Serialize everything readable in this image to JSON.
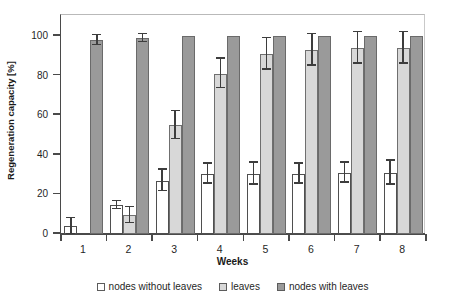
{
  "chart_data": {
    "type": "bar",
    "title": "",
    "subtitle": "",
    "xlabel": "Weeks",
    "ylabel": "Regeneration capacity [%]",
    "categories": [
      "1",
      "2",
      "3",
      "4",
      "5",
      "6",
      "7",
      "8"
    ],
    "xtick_labels": [
      "1",
      "2",
      "3",
      "4",
      "5",
      "6",
      "7",
      "8"
    ],
    "ytick_labels": [
      "0",
      "20",
      "40",
      "60",
      "80",
      "100"
    ],
    "ytick_values": [
      0,
      20,
      40,
      60,
      80,
      100
    ],
    "ylim": [
      0,
      100
    ],
    "grid": false,
    "legend_position": "bottom-outside",
    "series": [
      {
        "name": "nodes without leaves",
        "color": "#ffffff",
        "values": [
          4,
          14.5,
          27,
          30.5,
          30.5,
          30.5,
          31,
          31
        ],
        "errors": [
          4,
          2,
          5.5,
          5,
          5.5,
          5,
          5,
          6
        ]
      },
      {
        "name": "leaves",
        "color": "#d8d8d8",
        "values": [
          null,
          9.5,
          55,
          81,
          91,
          93,
          94,
          94
        ],
        "errors": [
          null,
          4,
          7,
          7.5,
          8,
          8,
          8,
          8
        ]
      },
      {
        "name": "nodes with leaves",
        "color": "#9a9a9a",
        "values": [
          98,
          99,
          100,
          100,
          100,
          100,
          100,
          100
        ],
        "errors": [
          2.5,
          2,
          0,
          0,
          0,
          0,
          0,
          0
        ]
      }
    ]
  },
  "legend": {
    "items": [
      {
        "label": "nodes without leaves",
        "swatch": "white-square-icon"
      },
      {
        "label": "leaves",
        "swatch": "light-gray-square-icon"
      },
      {
        "label": "nodes with leaves",
        "swatch": "dark-gray-square-icon"
      }
    ]
  },
  "colors": {
    "series_white": "#ffffff",
    "series_light_gray": "#d8d8d8",
    "series_dark_gray": "#9a9a9a",
    "axis": "#4a4a4a",
    "text": "#1f1f1f"
  }
}
